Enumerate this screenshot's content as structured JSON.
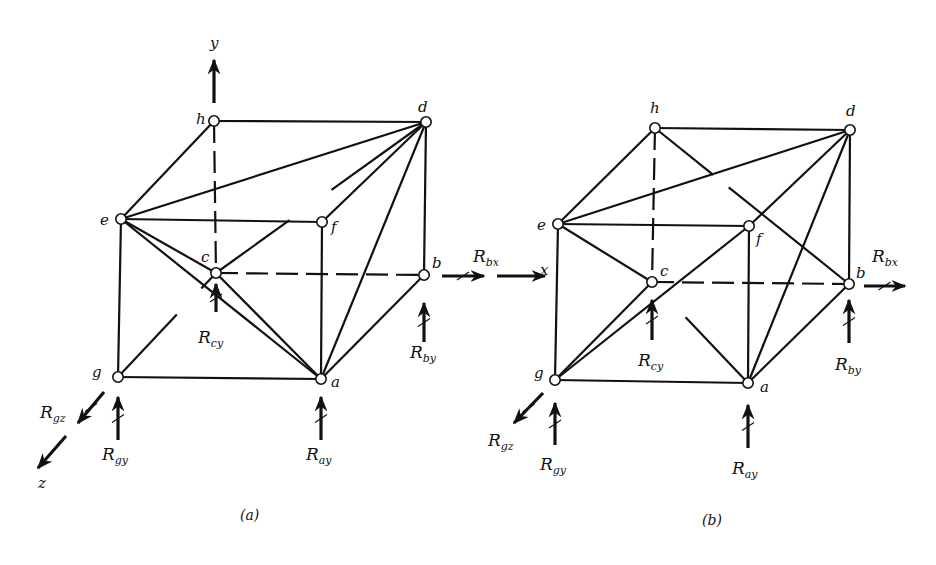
{
  "figure": {
    "colors": {
      "line": "#111111",
      "node_fill": "#ffffff",
      "background": "#ffffff"
    },
    "panels": [
      {
        "id": "a",
        "caption": "(a)",
        "caption_pos": [
          240,
          520
        ],
        "nodes": {
          "h": [
            214,
            121
          ],
          "d": [
            426,
            122
          ],
          "e": [
            121,
            219
          ],
          "f": [
            322,
            222
          ],
          "c": [
            216,
            273
          ],
          "b": [
            424,
            275
          ],
          "g": [
            118,
            377
          ],
          "a": [
            321,
            379
          ]
        },
        "node_labels": [
          {
            "text": "h",
            "x": 196,
            "y": 124
          },
          {
            "text": "d",
            "x": 418,
            "y": 112
          },
          {
            "text": "e",
            "x": 100,
            "y": 225
          },
          {
            "text": "f",
            "x": 331,
            "y": 232
          },
          {
            "text": "c",
            "x": 201,
            "y": 262
          },
          {
            "text": "b",
            "x": 432,
            "y": 268
          },
          {
            "text": "g",
            "x": 92,
            "y": 377
          },
          {
            "text": "a",
            "x": 331,
            "y": 387
          }
        ],
        "solid_edges": [
          [
            "h",
            "d"
          ],
          [
            "h",
            "e"
          ],
          [
            "e",
            "f"
          ],
          [
            "e",
            "d"
          ],
          [
            "d",
            "b"
          ],
          [
            "d",
            "a"
          ],
          [
            "d",
            "f"
          ],
          [
            "e",
            "g"
          ],
          [
            "g",
            "a"
          ],
          [
            "f",
            "a"
          ],
          [
            "a",
            "b"
          ],
          [
            "e",
            "a"
          ],
          [
            "e",
            "c"
          ],
          [
            "c",
            "a"
          ]
        ],
        "dashed_edges": [
          [
            "h",
            "c"
          ],
          [
            "c",
            "b"
          ]
        ],
        "partial_edges": [
          {
            "from": "c",
            "to": "d",
            "gap": [
              0.35,
              0.55
            ]
          },
          {
            "from": "g",
            "to": "c",
            "gap": [
              0.6,
              0.85
            ]
          }
        ],
        "forces": [
          {
            "name": "R",
            "sub": "cy",
            "x": 216,
            "y1": 312,
            "y2": 284,
            "dir": "up",
            "label_x": 198,
            "label_y": 343,
            "crossed": true
          },
          {
            "name": "R",
            "sub": "by",
            "x": 424,
            "y1": 342,
            "y2": 303,
            "dir": "up",
            "label_x": 410,
            "label_y": 358,
            "crossed": true
          },
          {
            "name": "R",
            "sub": "gy",
            "x": 118,
            "y1": 440,
            "y2": 397,
            "dir": "up",
            "label_x": 102,
            "label_y": 460,
            "crossed": true
          },
          {
            "name": "R",
            "sub": "ay",
            "x": 321,
            "y1": 440,
            "y2": 397,
            "dir": "up",
            "label_x": 306,
            "label_y": 460,
            "crossed": true
          }
        ],
        "diag_forces": [
          {
            "name": "R",
            "sub": "gz",
            "x1": 104,
            "y1": 392,
            "x2": 78,
            "y2": 423,
            "label_x": 40,
            "label_y": 418,
            "crossed": true
          }
        ],
        "h_forces": [
          {
            "x1": 442,
            "x2": 484,
            "y": 276,
            "crossed": true
          }
        ],
        "axes": [
          {
            "label": "y",
            "x1": 214,
            "y1": 103,
            "x2": 214,
            "y2": 60,
            "label_x": 210,
            "label_y": 48
          },
          {
            "label": "z",
            "x1": 66,
            "y1": 436,
            "x2": 38,
            "y2": 468,
            "label_x": 38,
            "label_y": 488
          }
        ]
      },
      {
        "id": "b",
        "caption": "(b)",
        "caption_pos": [
          702,
          525
        ],
        "nodes": {
          "h": [
            655,
            128
          ],
          "d": [
            850,
            130
          ],
          "e": [
            558,
            224
          ],
          "f": [
            749,
            226
          ],
          "c": [
            652,
            282
          ],
          "b": [
            849,
            284
          ],
          "g": [
            555,
            380
          ],
          "a": [
            748,
            383
          ]
        },
        "node_labels": [
          {
            "text": "h",
            "x": 650,
            "y": 113
          },
          {
            "text": "d",
            "x": 846,
            "y": 116
          },
          {
            "text": "e",
            "x": 537,
            "y": 230
          },
          {
            "text": "f",
            "x": 756,
            "y": 244
          },
          {
            "text": "c",
            "x": 660,
            "y": 276
          },
          {
            "text": "b",
            "x": 856,
            "y": 278
          },
          {
            "text": "g",
            "x": 534,
            "y": 378
          },
          {
            "text": "a",
            "x": 760,
            "y": 392
          }
        ],
        "solid_edges": [
          [
            "h",
            "d"
          ],
          [
            "h",
            "e"
          ],
          [
            "e",
            "f"
          ],
          [
            "e",
            "d"
          ],
          [
            "d",
            "b"
          ],
          [
            "d",
            "a"
          ],
          [
            "d",
            "f"
          ],
          [
            "e",
            "g"
          ],
          [
            "g",
            "a"
          ],
          [
            "f",
            "a"
          ],
          [
            "a",
            "b"
          ],
          [
            "e",
            "c"
          ],
          [
            "g",
            "c"
          ],
          [
            "g",
            "f"
          ]
        ],
        "dashed_edges": [
          [
            "h",
            "c"
          ],
          [
            "c",
            "b"
          ]
        ],
        "partial_edges": [
          {
            "from": "h",
            "to": "b",
            "gap": [
              0.3,
              0.38
            ]
          },
          {
            "from": "c",
            "to": "a",
            "gap": [
              0.0,
              0.35
            ]
          }
        ],
        "forces": [
          {
            "name": "R",
            "sub": "cy",
            "x": 652,
            "y1": 340,
            "y2": 300,
            "dir": "up",
            "label_x": 638,
            "label_y": 366,
            "crossed": true
          },
          {
            "name": "R",
            "sub": "by",
            "x": 849,
            "y1": 343,
            "y2": 300,
            "dir": "up",
            "label_x": 835,
            "label_y": 370,
            "crossed": true
          },
          {
            "name": "R",
            "sub": "gy",
            "x": 555,
            "y1": 445,
            "y2": 403,
            "dir": "up",
            "label_x": 540,
            "label_y": 470,
            "crossed": true
          },
          {
            "name": "R",
            "sub": "ay",
            "x": 748,
            "y1": 448,
            "y2": 405,
            "dir": "up",
            "label_x": 732,
            "label_y": 474,
            "crossed": true
          }
        ],
        "diag_forces": [
          {
            "name": "R",
            "sub": "gz",
            "x1": 543,
            "y1": 393,
            "x2": 514,
            "y2": 423,
            "label_x": 488,
            "label_y": 446,
            "crossed": true
          }
        ],
        "h_forces": [
          {
            "x1": 497,
            "x2": 545,
            "y": 276,
            "crossed": false,
            "label": {
              "name": "R",
              "sub": "bx",
              "x": 473,
              "y": 262
            }
          },
          {
            "x1": 864,
            "x2": 905,
            "y": 286,
            "crossed": true,
            "label": {
              "name": "R",
              "sub": "bx",
              "x": 872,
              "y": 262
            }
          }
        ],
        "axes": [
          {
            "label": "x",
            "x1": 0,
            "y1": 0,
            "x2": 0,
            "y2": 0,
            "label_x": 540,
            "label_y": 275
          }
        ]
      }
    ]
  }
}
